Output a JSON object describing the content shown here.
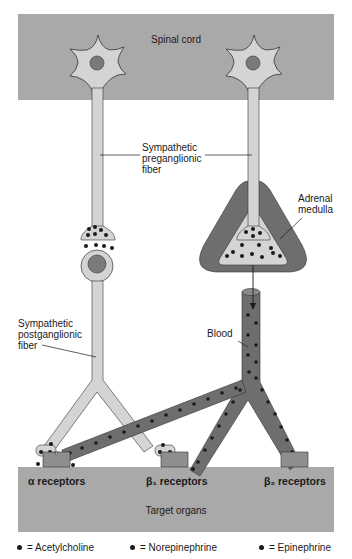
{
  "regions": {
    "spinal_cord": "Spinal cord",
    "target_organs": "Target organs"
  },
  "labels": {
    "preganglionic": [
      "Sympathetic",
      "preganglionic",
      "fiber"
    ],
    "postganglionic": [
      "Sympathetic",
      "postganglionic",
      "fiber"
    ],
    "adrenal_medulla": [
      "Adrenal",
      "medulla"
    ],
    "blood": "Blood"
  },
  "receptors": [
    {
      "label": "α receptors"
    },
    {
      "label": "β₁ receptors"
    },
    {
      "label": "β₂ receptors"
    }
  ],
  "legend": [
    {
      "symbol": "dot",
      "label": "= Acetylcholine"
    },
    {
      "symbol": "dot",
      "label": "= Norepinephrine"
    },
    {
      "symbol": "dot",
      "label": "= Epinephrine"
    }
  ],
  "colors": {
    "spinal_cord": "#a9a9a9",
    "target_organs": "#a9a9a9",
    "neuron_fill": "#d4d4d4",
    "nucleus": "#7a7a7a",
    "adrenal_outer": "#6e6e6e",
    "blood_vessel": "#6e6e6e",
    "receptor": "#8e8e8e",
    "dot": "#1a1a1a"
  }
}
